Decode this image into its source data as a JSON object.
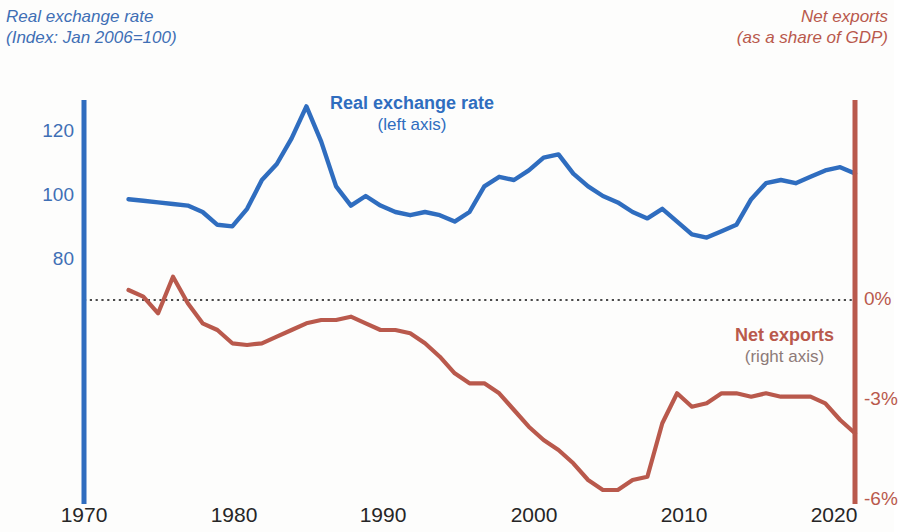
{
  "header": {
    "left_line1": "Real exchange rate",
    "left_line2": "(Index: Jan 2006=100)",
    "right_line1": "Net exports",
    "right_line2": "(as a share of GDP)"
  },
  "labels": {
    "blue_title": "Real exchange rate",
    "blue_sub": "(left axis)",
    "red_title": "Net exports",
    "red_sub": "(right axis)"
  },
  "colors": {
    "blue": "#2f6dbf",
    "blue_text": "#3f6fb5",
    "red": "#b9594c",
    "zero_line": "#4a4a4a",
    "background": "#fdfdfc"
  },
  "axes": {
    "left_ticks": [
      "120",
      "100",
      "80"
    ],
    "right_ticks": [
      "0%",
      "-3%",
      "-6%"
    ],
    "x_ticks": [
      "1970",
      "1980",
      "1990",
      "2000",
      "2010",
      "2020"
    ]
  },
  "chart_data": {
    "type": "line",
    "title": "",
    "subtitle": "",
    "xlabel": "",
    "ylabel": "Index: Jan 2006=100",
    "y2label": "Net exports as a share of GDP",
    "xlim": [
      1970,
      2022
    ],
    "ylim": [
      68,
      131
    ],
    "y2lim": [
      -6.9,
      1.1
    ],
    "grid": false,
    "zero_line": 0,
    "legend": "inline-annotations",
    "left_axis_ticks": [
      120,
      100,
      80
    ],
    "right_axis_ticks": [
      0,
      -3,
      -6
    ],
    "x_ticks": [
      1970,
      1980,
      1990,
      2000,
      2010,
      2020
    ],
    "series": [
      {
        "name": "Real exchange rate",
        "axis": "left",
        "color": "#2f6dbf",
        "unit": "index",
        "x": [
          1973,
          1974,
          1975,
          1976,
          1977,
          1978,
          1979,
          1980,
          1981,
          1982,
          1983,
          1984,
          1985,
          1986,
          1987,
          1988,
          1989,
          1990,
          1991,
          1992,
          1993,
          1994,
          1995,
          1996,
          1997,
          1998,
          1999,
          2000,
          2001,
          2002,
          2003,
          2004,
          2005,
          2006,
          2007,
          2008,
          2009,
          2010,
          2011,
          2012,
          2013,
          2014,
          2015,
          2016,
          2017,
          2018,
          2019,
          2020,
          2021,
          2022
        ],
        "values": [
          99,
          98.5,
          98,
          97.5,
          97,
          95,
          91,
          90.5,
          96,
          105,
          110,
          118,
          128,
          117,
          103,
          97,
          100,
          97,
          95,
          94,
          95,
          94,
          92,
          95,
          103,
          106,
          105,
          108,
          112,
          113,
          107,
          103,
          100,
          98,
          95,
          93,
          96,
          92,
          88,
          87,
          89,
          91,
          99,
          104,
          105,
          104,
          106,
          108,
          109,
          107
        ]
      },
      {
        "name": "Net exports",
        "axis": "right",
        "color": "#b9594c",
        "unit": "percent of GDP",
        "x": [
          1973,
          1974,
          1975,
          1976,
          1977,
          1978,
          1979,
          1980,
          1981,
          1982,
          1983,
          1984,
          1985,
          1986,
          1987,
          1988,
          1989,
          1990,
          1991,
          1992,
          1993,
          1994,
          1995,
          1996,
          1997,
          1998,
          1999,
          2000,
          2001,
          2002,
          2003,
          2004,
          2005,
          2006,
          2007,
          2008,
          2009,
          2010,
          2011,
          2012,
          2013,
          2014,
          2015,
          2016,
          2017,
          2018,
          2019,
          2020,
          2021,
          2022
        ],
        "values": [
          0.3,
          0.1,
          -0.4,
          0.7,
          -0.1,
          -0.7,
          -0.9,
          -1.3,
          -1.35,
          -1.3,
          -1.1,
          -0.9,
          -0.7,
          -0.6,
          -0.6,
          -0.5,
          -0.7,
          -0.9,
          -0.9,
          -1.0,
          -1.3,
          -1.7,
          -2.2,
          -2.5,
          -2.5,
          -2.8,
          -3.3,
          -3.8,
          -4.2,
          -4.5,
          -4.9,
          -5.4,
          -5.7,
          -5.7,
          -5.4,
          -5.3,
          -3.7,
          -2.8,
          -3.2,
          -3.1,
          -2.8,
          -2.8,
          -2.9,
          -2.8,
          -2.9,
          -2.9,
          -2.9,
          -3.1,
          -3.6,
          -4.0
        ]
      }
    ]
  }
}
